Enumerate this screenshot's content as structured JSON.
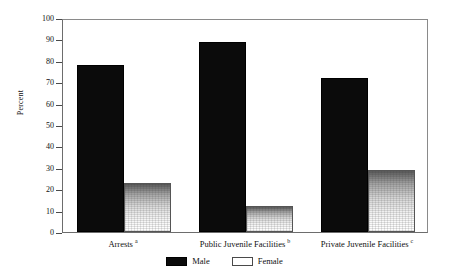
{
  "chart_data": {
    "type": "bar",
    "title": "",
    "subtitle": "",
    "xlabel": "",
    "ylabel": "Percent",
    "ylim": [
      0,
      100
    ],
    "yticks": [
      0,
      10,
      20,
      30,
      40,
      50,
      60,
      70,
      80,
      90,
      100
    ],
    "ytick_labels": [
      "0",
      "10",
      "20",
      "30",
      "40",
      "50",
      "60",
      "70",
      "80",
      "90",
      "100"
    ],
    "grid": false,
    "legend_position": "bottom-center",
    "categories": [
      "Arrests",
      "Public Juvenile Facilities",
      "Private Juvenile Facilities"
    ],
    "category_footnotes": [
      "a",
      "b",
      "c"
    ],
    "series": [
      {
        "name": "Male",
        "color": "#0b0b0b",
        "values": [
          78,
          89,
          72
        ]
      },
      {
        "name": "Female",
        "color": "#ffffff",
        "values": [
          23,
          12,
          29
        ]
      }
    ]
  }
}
